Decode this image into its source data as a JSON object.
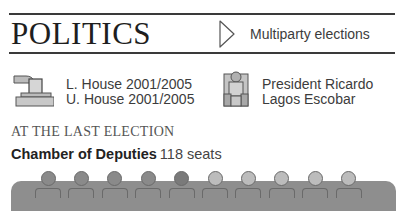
{
  "header": {
    "title": "POLITICS",
    "tag_icon": "triangle-right-outline-icon",
    "tag_label": "Multiparty elections"
  },
  "elections": {
    "icon": "ballot-box-icon",
    "lower_house": "L. House 2001/2005",
    "upper_house": "U. House 2001/2005"
  },
  "leader": {
    "icon": "throne-icon",
    "line1": "President Ricardo",
    "line2": "Lagos Escobar"
  },
  "last_election": {
    "heading": "AT THE LAST ELECTION",
    "chamber_name": "Chamber of Deputies",
    "chamber_seats": "118 seats"
  },
  "seat_figures": {
    "count": 10,
    "colors": {
      "band": "#8e8e8e",
      "dark": "#8a8a8a",
      "darker": "#7a7a7a",
      "light": "#bcbcbc"
    },
    "heads": [
      "dark",
      "dark",
      "dark",
      "dark",
      "darker",
      "light",
      "light",
      "light",
      "light",
      "light"
    ]
  }
}
